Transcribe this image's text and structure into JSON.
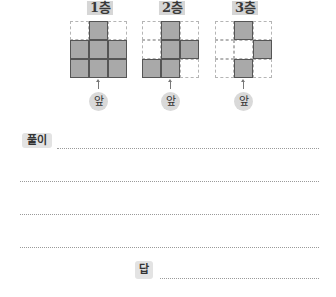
{
  "problem": {
    "layers": [
      {
        "label": "1층",
        "front_label": "앞",
        "grid": [
          [
            0,
            1,
            0
          ],
          [
            1,
            1,
            1
          ],
          [
            1,
            1,
            1
          ]
        ]
      },
      {
        "label": "2층",
        "front_label": "앞",
        "grid": [
          [
            0,
            1,
            0
          ],
          [
            0,
            1,
            1
          ],
          [
            1,
            1,
            0
          ]
        ]
      },
      {
        "label": "3층",
        "front_label": "앞",
        "grid": [
          [
            0,
            1,
            0
          ],
          [
            0,
            0,
            1
          ],
          [
            0,
            1,
            0
          ]
        ]
      }
    ]
  },
  "solution": {
    "label": "풀이",
    "line_count": 4
  },
  "answer": {
    "label": "답"
  },
  "colors": {
    "filled_cell": "#a9a9a9",
    "label_bg": "#d6d6d6",
    "badge_bg": "#e3e3e3"
  }
}
